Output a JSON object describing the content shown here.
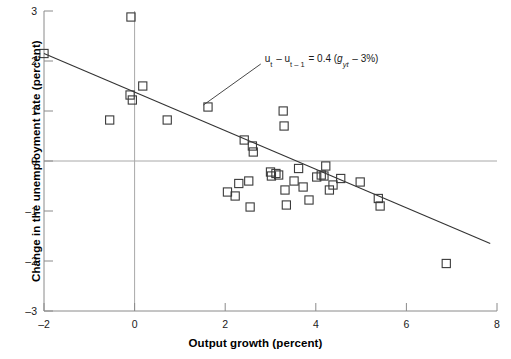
{
  "chart_data": {
    "type": "scatter",
    "title": "",
    "xlabel": "Output growth (percent)",
    "ylabel": "Change in the unemployment rate (percent)",
    "xlim": [
      -2,
      8
    ],
    "ylim": [
      -3,
      3
    ],
    "xticks": [
      -2,
      0,
      2,
      4,
      6,
      8
    ],
    "xticklabels": [
      "–2",
      "0",
      "2",
      "4",
      "6",
      "8"
    ],
    "yticks": [
      -3,
      -2,
      -1,
      0,
      1,
      2,
      3
    ],
    "yticklabels": [
      "–3",
      "–2",
      "–1",
      "0",
      "1",
      "2",
      "3"
    ],
    "grid": false,
    "zero_lines": {
      "horizontal_y": 0,
      "vertical_x": 0
    },
    "legend": "none",
    "marker": "open-square",
    "annotation": {
      "text": "uₜ – uₜ₋₁ = 0.4 (gᵧₜ – 3%)",
      "parts": {
        "lhs_var": "u",
        "lhs_sub1": "t",
        "minus": "–",
        "lhs_sub2": "t – 1",
        "equals": "=",
        "coefficient": "0.4",
        "paren_open": "(",
        "rhs_var": "g",
        "rhs_sub": "yt",
        "rhs_const": "3%",
        "paren_close": ")"
      },
      "x": 3.05,
      "y": 2.06
    },
    "fit_line": {
      "label": "regression line",
      "x": [
        -2.0,
        7.85
      ],
      "y": [
        2.15,
        -1.65
      ],
      "slope": -0.386,
      "intercept": 0.993
    },
    "points": [
      {
        "x": -2.0,
        "y": 2.15
      },
      {
        "x": -0.55,
        "y": 0.82
      },
      {
        "x": -0.1,
        "y": 1.32
      },
      {
        "x": -0.05,
        "y": 1.22
      },
      {
        "x": 0.18,
        "y": 1.5
      },
      {
        "x": -0.08,
        "y": 2.88
      },
      {
        "x": 0.72,
        "y": 0.82
      },
      {
        "x": 1.62,
        "y": 1.08
      },
      {
        "x": 2.42,
        "y": 0.42
      },
      {
        "x": 2.6,
        "y": 0.3
      },
      {
        "x": 2.62,
        "y": 0.18
      },
      {
        "x": 3.28,
        "y": 1.0
      },
      {
        "x": 3.3,
        "y": 0.7
      },
      {
        "x": 2.3,
        "y": -0.45
      },
      {
        "x": 2.05,
        "y": -0.62
      },
      {
        "x": 2.22,
        "y": -0.7
      },
      {
        "x": 2.52,
        "y": -0.4
      },
      {
        "x": 2.55,
        "y": -0.92
      },
      {
        "x": 3.0,
        "y": -0.22
      },
      {
        "x": 3.02,
        "y": -0.3
      },
      {
        "x": 3.12,
        "y": -0.25
      },
      {
        "x": 3.18,
        "y": -0.28
      },
      {
        "x": 3.32,
        "y": -0.58
      },
      {
        "x": 3.35,
        "y": -0.88
      },
      {
        "x": 3.52,
        "y": -0.4
      },
      {
        "x": 3.62,
        "y": -0.15
      },
      {
        "x": 3.72,
        "y": -0.52
      },
      {
        "x": 3.85,
        "y": -0.78
      },
      {
        "x": 4.02,
        "y": -0.32
      },
      {
        "x": 4.12,
        "y": -0.28
      },
      {
        "x": 4.18,
        "y": -0.3
      },
      {
        "x": 4.22,
        "y": -0.1
      },
      {
        "x": 4.3,
        "y": -0.58
      },
      {
        "x": 4.38,
        "y": -0.48
      },
      {
        "x": 4.55,
        "y": -0.35
      },
      {
        "x": 4.98,
        "y": -0.42
      },
      {
        "x": 5.38,
        "y": -0.75
      },
      {
        "x": 5.42,
        "y": -0.9
      },
      {
        "x": 6.88,
        "y": -2.05
      }
    ]
  },
  "style": {
    "marker_color": "#3a3a3a",
    "line_color": "#333333",
    "axis_color": "#8a8a8a",
    "zero_line_color": "#a8a8a8",
    "text_color": "#1a1a1a",
    "background": "#ffffff"
  }
}
